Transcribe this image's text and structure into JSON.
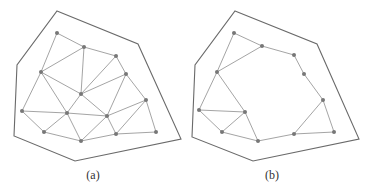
{
  "colors": {
    "boundary": "#6a6a6a",
    "edge": "#9a9a9a",
    "node": "#777777",
    "caption": "#333333"
  },
  "panels": [
    {
      "id": "a",
      "caption": "(a)",
      "caption_x": 93,
      "boundary": [
        [
          57,
          11
        ],
        [
          138,
          44
        ],
        [
          181,
          139
        ],
        [
          75,
          161
        ],
        [
          14,
          136
        ],
        [
          17,
          65
        ]
      ],
      "nodes": [
        [
          57,
          33
        ],
        [
          84,
          47
        ],
        [
          116,
          56
        ],
        [
          126,
          74
        ],
        [
          41,
          72
        ],
        [
          81,
          94
        ],
        [
          146,
          100
        ],
        [
          22,
          111
        ],
        [
          67,
          113
        ],
        [
          107,
          116
        ],
        [
          44,
          132
        ],
        [
          81,
          141
        ],
        [
          116,
          134
        ],
        [
          156,
          132
        ]
      ],
      "edges": [
        [
          0,
          1
        ],
        [
          0,
          4
        ],
        [
          1,
          2
        ],
        [
          1,
          4
        ],
        [
          1,
          5
        ],
        [
          2,
          3
        ],
        [
          2,
          5
        ],
        [
          3,
          5
        ],
        [
          3,
          6
        ],
        [
          3,
          9
        ],
        [
          4,
          5
        ],
        [
          4,
          7
        ],
        [
          4,
          8
        ],
        [
          5,
          8
        ],
        [
          5,
          9
        ],
        [
          7,
          8
        ],
        [
          7,
          10
        ],
        [
          8,
          10
        ],
        [
          8,
          11
        ],
        [
          8,
          9
        ],
        [
          9,
          11
        ],
        [
          9,
          12
        ],
        [
          9,
          6
        ],
        [
          6,
          12
        ],
        [
          6,
          13
        ],
        [
          12,
          13
        ],
        [
          11,
          12
        ],
        [
          10,
          11
        ]
      ]
    },
    {
      "id": "b",
      "caption": "(b)",
      "caption_x": 272,
      "boundary": [
        [
          235,
          11
        ],
        [
          317,
          44
        ],
        [
          359,
          139
        ],
        [
          253,
          161
        ],
        [
          192,
          137
        ],
        [
          195,
          65
        ]
      ],
      "nodes": [
        [
          234,
          33
        ],
        [
          262,
          46
        ],
        [
          217,
          72
        ],
        [
          294,
          55
        ],
        [
          304,
          74
        ],
        [
          323,
          100
        ],
        [
          334,
          132
        ],
        [
          294,
          134
        ],
        [
          199,
          110
        ],
        [
          245,
          112
        ],
        [
          222,
          132
        ],
        [
          258,
          141
        ]
      ],
      "edges": [
        [
          0,
          1
        ],
        [
          0,
          2
        ],
        [
          1,
          2
        ],
        [
          1,
          3
        ],
        [
          3,
          4
        ],
        [
          4,
          5
        ],
        [
          5,
          6
        ],
        [
          5,
          7
        ],
        [
          6,
          7
        ],
        [
          7,
          11
        ],
        [
          11,
          9
        ],
        [
          11,
          10
        ],
        [
          9,
          2
        ],
        [
          9,
          8
        ],
        [
          9,
          10
        ],
        [
          8,
          10
        ],
        [
          8,
          2
        ]
      ]
    }
  ]
}
